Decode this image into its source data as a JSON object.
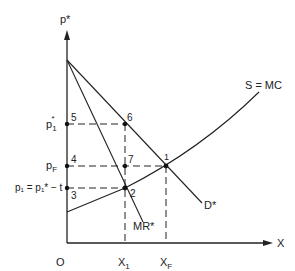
{
  "diagram": {
    "type": "economics-supply-demand",
    "axes": {
      "y_label": "p*",
      "x_label": "X",
      "origin_label": "O"
    },
    "curves": {
      "supply": "S = MC",
      "demand": "D*",
      "marginal_revenue": "MR*"
    },
    "price_levels": {
      "p1_star": {
        "base": "p",
        "sub": "1",
        "sup": "*"
      },
      "pF": {
        "base": "p",
        "sub": "F"
      },
      "p1_eq": "p₁ = p₁* − t"
    },
    "quantity_levels": {
      "x1": {
        "base": "X",
        "sub": "1"
      },
      "xF": {
        "base": "X",
        "sub": "F"
      }
    },
    "points": [
      "1",
      "2",
      "3",
      "4",
      "5",
      "6",
      "7"
    ]
  }
}
